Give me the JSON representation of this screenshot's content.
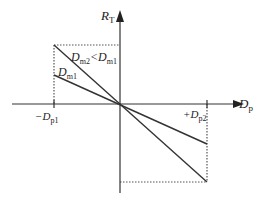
{
  "diagram": {
    "axes": {
      "y_label_main": "R",
      "y_label_sub": "T",
      "x_label_main": "D",
      "x_label_sub": "p"
    },
    "ticks": {
      "left_main": "−D",
      "left_sub": "p1",
      "right_main": "+D",
      "right_sub": "p2"
    },
    "lines": [
      {
        "label_main": "D",
        "label_sub": "m2",
        "label_rest": "<D",
        "label_sub2": "m1",
        "from": [
          54,
          45
        ],
        "to": [
          207,
          182
        ]
      },
      {
        "label_main": "D",
        "label_sub": "m1",
        "from": [
          54,
          75
        ],
        "to": [
          207,
          144
        ]
      }
    ],
    "colors": {
      "line": "#333333",
      "dotted": "#555555"
    }
  }
}
